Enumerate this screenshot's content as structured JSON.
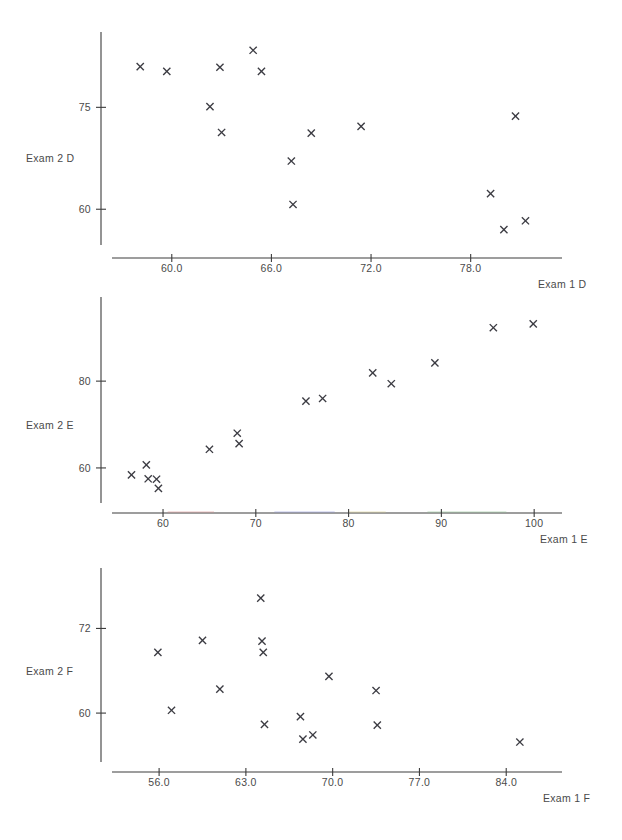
{
  "header": {
    "clipped_text": "·   ·    · · ·"
  },
  "chart_data": [
    {
      "type": "scatter",
      "id": "panel-d",
      "title": "",
      "xlabel": "Exam 1 D",
      "ylabel": "Exam 2 D",
      "xticks": [
        "60.0",
        "66.0",
        "72.0",
        "78.0"
      ],
      "xtick_values": [
        60.0,
        66.0,
        72.0,
        78.0
      ],
      "yticks": [
        "75",
        "60"
      ],
      "ytick_values": [
        75,
        60
      ],
      "xlim": [
        56.4,
        83.5
      ],
      "ylim": [
        54.0,
        85.5
      ],
      "grid": false,
      "legend": null,
      "marker": "x",
      "marker_color": "#3b3b42",
      "points": [
        {
          "x": 58.1,
          "y": 81.0
        },
        {
          "x": 59.7,
          "y": 80.3
        },
        {
          "x": 62.3,
          "y": 75.1
        },
        {
          "x": 62.9,
          "y": 80.9
        },
        {
          "x": 63.0,
          "y": 71.3
        },
        {
          "x": 64.9,
          "y": 83.4
        },
        {
          "x": 65.4,
          "y": 80.3
        },
        {
          "x": 67.2,
          "y": 67.1
        },
        {
          "x": 67.3,
          "y": 60.7
        },
        {
          "x": 68.4,
          "y": 71.2
        },
        {
          "x": 71.4,
          "y": 72.2
        },
        {
          "x": 79.2,
          "y": 62.3
        },
        {
          "x": 80.0,
          "y": 57.0
        },
        {
          "x": 80.7,
          "y": 73.7
        },
        {
          "x": 81.3,
          "y": 58.3
        }
      ]
    },
    {
      "type": "scatter",
      "id": "panel-e",
      "title": "",
      "xlabel": "Exam 1 E",
      "ylabel": "Exam 2 E",
      "xticks": [
        "60",
        "70",
        "80",
        "90",
        "100"
      ],
      "xtick_values": [
        60,
        70,
        80,
        90,
        100
      ],
      "yticks": [
        "80",
        "60"
      ],
      "ytick_values": [
        80,
        60
      ],
      "xlim": [
        54.5,
        103.0
      ],
      "ylim": [
        51.0,
        98.0
      ],
      "grid": false,
      "legend": null,
      "marker": "x",
      "marker_color": "#3b3b42",
      "axis_color_segments": [
        {
          "from": 60.5,
          "to": 65.5,
          "color": "#d98d8d"
        },
        {
          "from": 72.0,
          "to": 78.5,
          "color": "#8d93d9"
        },
        {
          "from": 80.0,
          "to": 84.0,
          "color": "#d9cf8d"
        },
        {
          "from": 88.5,
          "to": 97.0,
          "color": "#8dbf90"
        }
      ],
      "points": [
        {
          "x": 56.6,
          "y": 58.4
        },
        {
          "x": 58.2,
          "y": 60.7
        },
        {
          "x": 58.4,
          "y": 57.5
        },
        {
          "x": 59.3,
          "y": 57.4
        },
        {
          "x": 59.5,
          "y": 55.3
        },
        {
          "x": 65.0,
          "y": 64.3
        },
        {
          "x": 68.0,
          "y": 68.0
        },
        {
          "x": 68.2,
          "y": 65.6
        },
        {
          "x": 75.4,
          "y": 75.4
        },
        {
          "x": 77.2,
          "y": 76.0
        },
        {
          "x": 82.6,
          "y": 81.9
        },
        {
          "x": 84.6,
          "y": 79.4
        },
        {
          "x": 89.3,
          "y": 84.2
        },
        {
          "x": 95.6,
          "y": 92.3
        },
        {
          "x": 99.9,
          "y": 93.2
        }
      ]
    },
    {
      "type": "scatter",
      "id": "panel-f",
      "title": "",
      "xlabel": "Exam 1 F",
      "ylabel": "Exam 2 F",
      "xticks": [
        "56.0",
        "63.0",
        "70.0",
        "77.0",
        "84.0"
      ],
      "xtick_values": [
        56.0,
        63.0,
        70.0,
        77.0,
        84.0
      ],
      "yticks": [
        "72",
        "60"
      ],
      "ytick_values": [
        72,
        60
      ],
      "xlim": [
        52.2,
        88.5
      ],
      "ylim": [
        52.5,
        80.0
      ],
      "grid": false,
      "legend": null,
      "marker": "x",
      "marker_color": "#3b3b42",
      "points": [
        {
          "x": 55.9,
          "y": 68.6
        },
        {
          "x": 57.0,
          "y": 60.4
        },
        {
          "x": 59.5,
          "y": 70.3
        },
        {
          "x": 60.9,
          "y": 63.4
        },
        {
          "x": 64.2,
          "y": 76.3
        },
        {
          "x": 64.3,
          "y": 70.2
        },
        {
          "x": 64.4,
          "y": 68.6
        },
        {
          "x": 64.5,
          "y": 58.4
        },
        {
          "x": 67.4,
          "y": 59.5
        },
        {
          "x": 67.6,
          "y": 56.3
        },
        {
          "x": 68.4,
          "y": 56.9
        },
        {
          "x": 69.7,
          "y": 65.2
        },
        {
          "x": 73.5,
          "y": 63.2
        },
        {
          "x": 73.6,
          "y": 58.3
        },
        {
          "x": 85.1,
          "y": 55.9
        }
      ]
    }
  ]
}
